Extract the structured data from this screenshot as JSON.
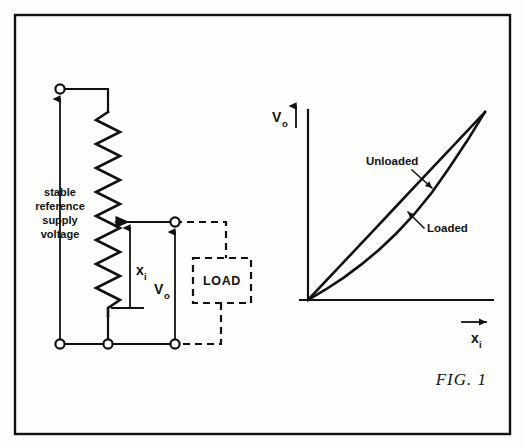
{
  "figure": {
    "caption": "FIG.  1",
    "border_color": "#111111",
    "ink_color": "#111111",
    "background_color": "#fdfdfc"
  },
  "circuit": {
    "supply_label_lines": [
      "stable",
      "reference",
      "supply",
      "voltage"
    ],
    "wiper_input_label": "x",
    "wiper_input_sub": "i",
    "output_label": "V",
    "output_sub": "o",
    "load_label": "LOAD",
    "component": "potentiometer",
    "terminals": [
      {
        "name": "supply-top-terminal"
      },
      {
        "name": "supply-bottom-terminal"
      },
      {
        "name": "pot-bottom-terminal"
      },
      {
        "name": "output-top-terminal"
      },
      {
        "name": "output-bottom-terminal"
      }
    ]
  },
  "chart_data": {
    "type": "line",
    "title": "",
    "xlabel": "x",
    "xlabel_sub": "i",
    "ylabel": "V",
    "ylabel_sub": "o",
    "grid": false,
    "legend_position": "inline-annotation",
    "xlim": [
      0,
      1
    ],
    "ylim": [
      0,
      1
    ],
    "axis_ticks": false,
    "series": [
      {
        "name": "Unloaded",
        "label": "Unloaded",
        "description": "straight proportional response",
        "x": [
          0,
          0.1,
          0.2,
          0.3,
          0.4,
          0.5,
          0.6,
          0.7,
          0.8,
          0.9,
          1.0
        ],
        "values": [
          0,
          0.1,
          0.2,
          0.3,
          0.4,
          0.5,
          0.6,
          0.7,
          0.8,
          0.9,
          1.0
        ]
      },
      {
        "name": "Loaded",
        "label": "Loaded",
        "description": "non-linear response sagging below the unloaded line",
        "x": [
          0,
          0.1,
          0.2,
          0.3,
          0.4,
          0.5,
          0.6,
          0.7,
          0.8,
          0.9,
          1.0
        ],
        "values": [
          0,
          0.056,
          0.118,
          0.188,
          0.266,
          0.355,
          0.456,
          0.572,
          0.706,
          0.848,
          1.0
        ]
      }
    ],
    "annotations": [
      {
        "text": "Unloaded",
        "points_to": "Unloaded"
      },
      {
        "text": "Loaded",
        "points_to": "Loaded"
      }
    ]
  }
}
